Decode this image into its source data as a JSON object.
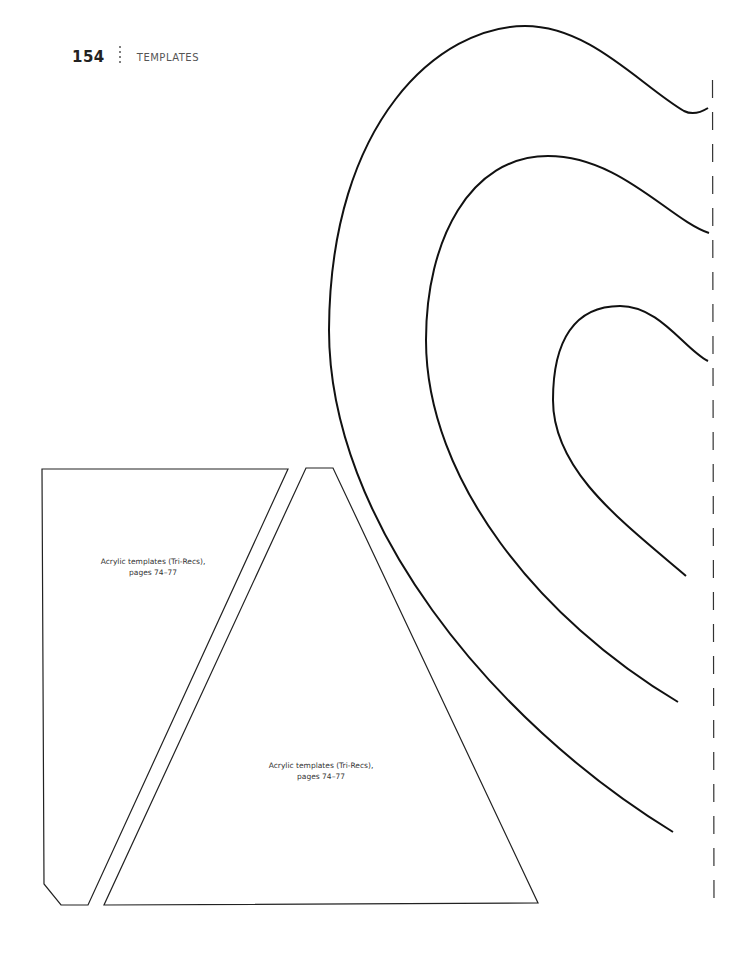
{
  "header": {
    "page_number": "154",
    "section_title": "TEMPLATES"
  },
  "templates": [
    {
      "name": "tri-rec-side-piece",
      "caption_line1": "Acrylic templates (Tri-Recs),",
      "caption_line2": "pages 74–77"
    },
    {
      "name": "tri-rec-triangle",
      "caption_line1": "Acrylic templates (Tri-Recs),",
      "caption_line2": "pages 74–77"
    }
  ],
  "colors": {
    "line": "#111111",
    "text": "#333333",
    "background": "#ffffff"
  }
}
